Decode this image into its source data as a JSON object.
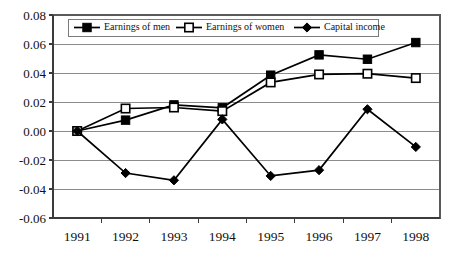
{
  "chart_data": {
    "type": "line",
    "title": "",
    "subtitle": "",
    "xlabel": "",
    "ylabel": "",
    "categories": [
      "1991",
      "1992",
      "1993",
      "1994",
      "1995",
      "1996",
      "1997",
      "1998"
    ],
    "series": [
      {
        "name": "Earnings of men",
        "marker": "filled-square",
        "color": "#000000",
        "values": [
          0.0,
          0.0075,
          0.018,
          0.016,
          0.0385,
          0.0525,
          0.0495,
          0.061
        ]
      },
      {
        "name": "Earnings of women",
        "marker": "open-square",
        "color": "#000000",
        "values": [
          0.0,
          0.0155,
          0.0162,
          0.0137,
          0.0335,
          0.039,
          0.0395,
          0.0365
        ]
      },
      {
        "name": "Capital income",
        "marker": "filled-diamond",
        "color": "#000000",
        "values": [
          0.0,
          -0.029,
          -0.034,
          0.008,
          -0.031,
          -0.027,
          0.015,
          -0.011
        ]
      }
    ],
    "ylim": [
      -0.06,
      0.08
    ],
    "ytick_labels": [
      "0.08",
      "0.06",
      "0.04",
      "0.02",
      "0.00",
      "-0.02",
      "-0.04",
      "-0.06"
    ],
    "ytick_values": [
      0.08,
      0.06,
      0.04,
      0.02,
      0.0,
      -0.02,
      -0.04,
      -0.06
    ],
    "grid": true,
    "grid_axis": "y",
    "legend_position": "top-inside",
    "legend": [
      "Earnings of men",
      "Earnings of women",
      "Capital income"
    ],
    "annotations": []
  },
  "style": {
    "plot_background": "#ffffff",
    "grid_color": "#8c8c8c",
    "axis_color": "#3b3b3b",
    "series_color": "#000000"
  }
}
